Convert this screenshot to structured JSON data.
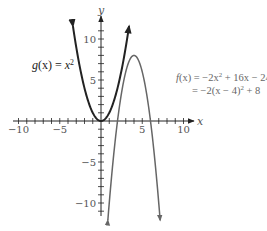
{
  "chart_data": {
    "type": "line",
    "title": "",
    "xlabel": "x",
    "ylabel": "y",
    "xlim": [
      -11,
      11
    ],
    "ylim": [
      -11.5,
      12.5
    ],
    "x_ticks": [
      -10,
      -5,
      5,
      10
    ],
    "y_ticks": [
      -10,
      -5,
      5,
      10
    ],
    "x_tick_labels": [
      "−10",
      "−5",
      "5",
      "10"
    ],
    "y_tick_labels": [
      "−10",
      "−5",
      "5",
      "10"
    ],
    "minor_tick_step": 1,
    "grid": false,
    "series": [
      {
        "name": "g(x) = x^2",
        "expression": "x^2",
        "color": "#222222",
        "stroke_width": 2,
        "x": [
          -3.4,
          -3,
          -2,
          -1,
          0,
          1,
          2,
          3,
          3.4
        ],
        "y": [
          11.56,
          9,
          4,
          1,
          0,
          1,
          4,
          9,
          11.56
        ]
      },
      {
        "name": "f(x) = -2x^2 + 16x - 24 = -2(x - 4)^2 + 8",
        "expression": "-2x^2 + 16x - 24",
        "color": "#666666",
        "stroke_width": 1.5,
        "vertex": [
          4,
          8
        ],
        "x": [
          0.83,
          1,
          2,
          3,
          4,
          5,
          6,
          7,
          7.17
        ],
        "y": [
          -12.1,
          -10,
          0,
          6,
          8,
          6,
          0,
          -10,
          -12.1
        ]
      }
    ],
    "annotations": [
      {
        "text": "g(x) = x²",
        "position": "left of y-axis, near y=7"
      },
      {
        "text": "f(x) = −2x² + 16x − 24",
        "position": "right, near y=5"
      },
      {
        "text": "= −2(x − 4)² + 8",
        "position": "right, below first line"
      }
    ]
  },
  "labels": {
    "x_axis": "x",
    "y_axis": "y",
    "g_lhs": "g",
    "g_arg": "(x) = ",
    "g_var": "x",
    "g_exp": "2",
    "f_line1_pre": "f",
    "f_line1_rest": "(x) = −2x",
    "f_line1_exp": "2",
    "f_line1_tail": " + 16x − 24",
    "f_line2_pre": "= −2(x − 4)",
    "f_line2_exp": "2",
    "f_line2_tail": " + 8"
  }
}
